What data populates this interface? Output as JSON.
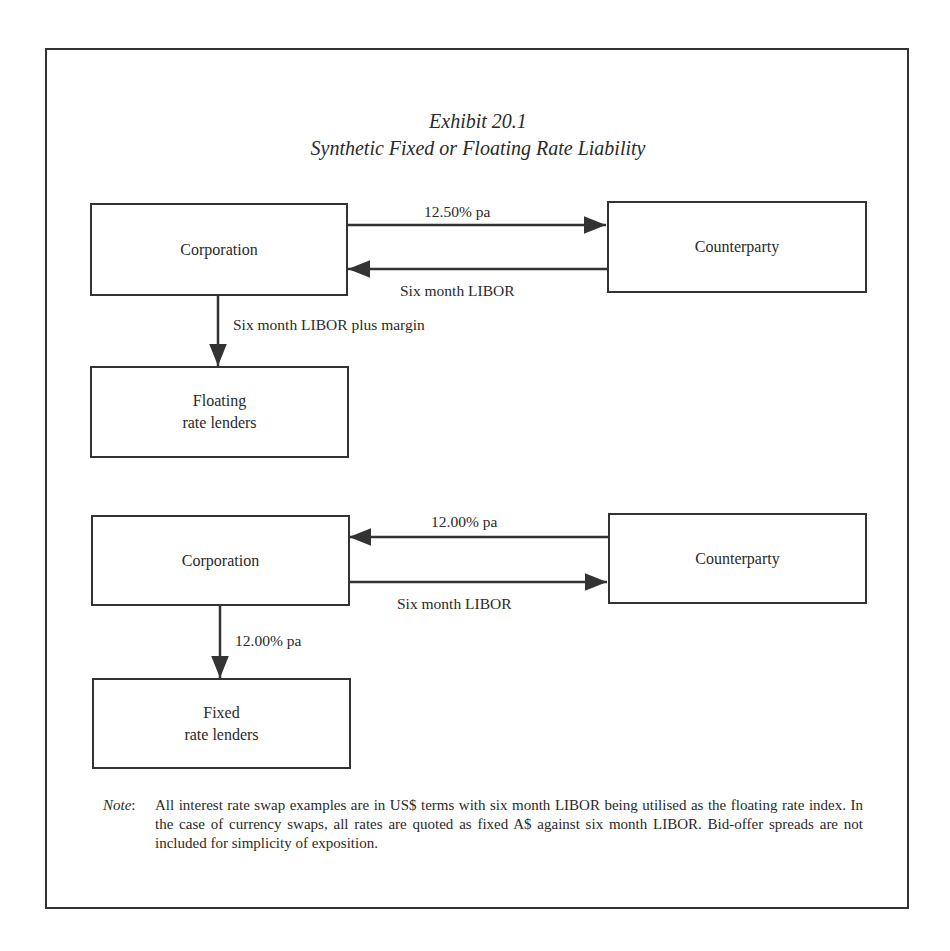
{
  "exhibit": {
    "number_label": "Exhibit 20.1",
    "title": "Synthetic Fixed or Floating Rate Liability"
  },
  "diagram_top": {
    "corporation": {
      "label": "Corporation"
    },
    "counterparty": {
      "label": "Counterparty"
    },
    "lenders": {
      "line1": "Floating",
      "line2": "rate lenders"
    },
    "arrow_corp_to_counterparty": {
      "label": "12.50% pa",
      "direction": "corporation→counterparty"
    },
    "arrow_counterparty_to_corp": {
      "label": "Six month LIBOR",
      "direction": "counterparty→corporation"
    },
    "arrow_corp_to_lenders": {
      "label": "Six month LIBOR plus margin",
      "direction": "corporation→lenders"
    }
  },
  "diagram_bottom": {
    "corporation": {
      "label": "Corporation"
    },
    "counterparty": {
      "label": "Counterparty"
    },
    "lenders": {
      "line1": "Fixed",
      "line2": "rate lenders"
    },
    "arrow_counterparty_to_corp": {
      "label": "12.00% pa",
      "direction": "counterparty→corporation"
    },
    "arrow_corp_to_counterparty": {
      "label": "Six month LIBOR",
      "direction": "corporation→counterparty"
    },
    "arrow_corp_to_lenders": {
      "label": "12.00% pa",
      "direction": "corporation→lenders"
    }
  },
  "note": {
    "label": "Note",
    "colon": ":",
    "text": "All interest rate swap examples are in US$ terms with six month LIBOR being utilised as the floating rate index. In the case of currency swaps, all rates are quoted as fixed A$ against six month LIBOR. Bid-offer spreads are not included for simplicity of exposition."
  },
  "colors": {
    "ink": "#2a2a2a",
    "line": "#333333",
    "background": "#ffffff"
  }
}
